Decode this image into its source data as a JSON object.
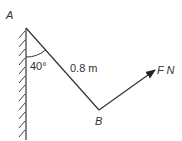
{
  "diagram": {
    "title": "",
    "labels": {
      "point_a": "A",
      "point_b": "B",
      "angle": "40°",
      "length": "0.8 m",
      "force": "F N"
    },
    "elements": {
      "wall": {
        "type": "fixed-wall",
        "hatched": true
      },
      "rod": {
        "from": "A",
        "to": "B",
        "length_m": 0.8,
        "angle_from_vertical_deg": 40
      },
      "force": {
        "at": "B",
        "symbol": "F",
        "unit": "N",
        "direction": "up-right"
      }
    },
    "colors": {
      "line": "#333333",
      "text": "#333333",
      "background": "#ffffff"
    }
  }
}
